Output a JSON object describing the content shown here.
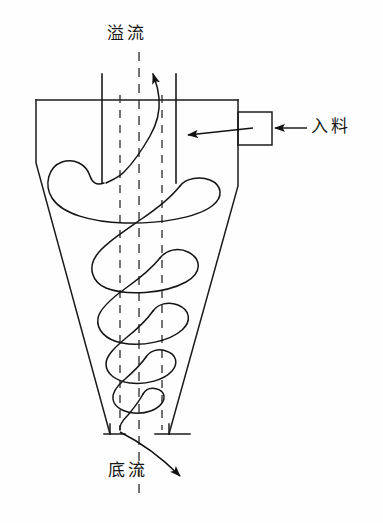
{
  "diagram": {
    "type": "hydrocyclone-schematic",
    "title_present": false,
    "background_color": "#fefefe",
    "line_color": "#161616",
    "labels": {
      "overflow": "溢流",
      "feed": "入料",
      "underflow": "底流"
    },
    "label_meanings": {
      "overflow": "overflow outlet at top (vortex finder)",
      "feed": "feed inlet at upper right side",
      "underflow": "underflow outlet at bottom apex"
    },
    "parts": {
      "vortex_finder": "central overflow pipe",
      "cylindrical_section": "upper cylinder body",
      "conical_section": "tapering cone body",
      "feed_inlet_box": "rectangular tangential feed nozzle",
      "apex_flange": "bottom discharge flange",
      "spiral_flow": "descending spiral flow path of slurry",
      "axis_centerline": "dash-dot vertical centerline"
    },
    "arrows": {
      "overflow_arrow_direction": "up",
      "feed_arrow_direction": "left",
      "underflow_arrow_direction": "down-right"
    },
    "geometry": {
      "body_top_y": 100,
      "body_left_x": 36,
      "body_right_x": 238,
      "apex_y": 435,
      "vortex_finder_left_x": 102,
      "vortex_finder_right_x": 176,
      "vortex_finder_top_y": 74,
      "vortex_finder_bottom_y": 183,
      "centerline_x": 139,
      "feed_box": {
        "x": 238,
        "y": 112,
        "width": 34,
        "height": 33
      }
    }
  }
}
